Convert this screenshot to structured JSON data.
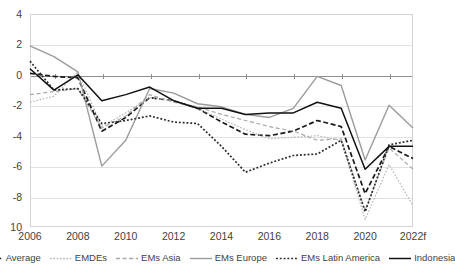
{
  "chart_data": {
    "type": "line",
    "title": "",
    "subtitle": "",
    "xlabel": "",
    "ylabel": "",
    "x": [
      2006,
      2007,
      2008,
      2009,
      2010,
      2011,
      2012,
      2013,
      2014,
      2015,
      2016,
      2017,
      2018,
      2019,
      2020,
      2021,
      2022
    ],
    "tick_labels": [
      "2006",
      "2008",
      "2010",
      "2012",
      "2014",
      "2016",
      "2018",
      "2020",
      "2022f"
    ],
    "tick_years": [
      2006,
      2008,
      2010,
      2012,
      2014,
      2016,
      2018,
      2020,
      2022
    ],
    "y_ticks": [
      "4",
      "2",
      "0",
      "-2",
      "-4",
      "-6",
      "-8",
      "10"
    ],
    "y_tick_values": [
      4,
      2,
      0,
      -2,
      -4,
      -6,
      -8,
      -10
    ],
    "ylim": [
      -10,
      4
    ],
    "xlim": [
      2006,
      2022
    ],
    "grid": true,
    "legend_position": "bottom",
    "series": [
      {
        "name": "Average",
        "style": "dashed",
        "color": "#1a1a1a",
        "values": [
          0.1,
          -0.1,
          -0.2,
          -3.7,
          -2.8,
          -1.5,
          -1.7,
          -2.2,
          -3.1,
          -3.9,
          -4.0,
          -3.7,
          -3.0,
          -3.4,
          -7.8,
          -4.7,
          -5.5
        ]
      },
      {
        "name": "EMDEs",
        "style": "dotted-light",
        "color": "#b5b5b5",
        "values": [
          -1.8,
          -1.4,
          0.2,
          -3.4,
          -2.5,
          -1.5,
          -1.7,
          -2.2,
          -2.9,
          -3.6,
          -4.2,
          -4.1,
          -4.0,
          -4.3,
          -9.5,
          -5.9,
          -8.6
        ]
      },
      {
        "name": "EMs Asia",
        "style": "dashed-light",
        "color": "#a8a8a8",
        "values": [
          -1.3,
          -1.1,
          -0.9,
          -3.5,
          -2.7,
          -1.3,
          -1.8,
          -2.1,
          -2.6,
          -3.0,
          -3.4,
          -3.7,
          -4.3,
          -4.2,
          -8.9,
          -4.8,
          -6.2
        ]
      },
      {
        "name": "EMs Europe",
        "style": "solid-light",
        "color": "#9b9b9b",
        "values": [
          1.9,
          1.2,
          0.2,
          -6.0,
          -4.3,
          -0.9,
          -1.2,
          -1.9,
          -2.1,
          -2.6,
          -2.8,
          -2.2,
          -0.1,
          -0.7,
          -5.6,
          -2.0,
          -3.5
        ]
      },
      {
        "name": "EMs Latin America",
        "style": "dotted",
        "color": "#2b2b2b",
        "values": [
          0.9,
          -1.0,
          -0.9,
          -3.2,
          -3.0,
          -2.7,
          -3.1,
          -3.2,
          -4.7,
          -6.4,
          -5.8,
          -5.3,
          -5.2,
          -4.3,
          -9.0,
          -4.6,
          -4.3
        ]
      },
      {
        "name": "Indonesia",
        "style": "solid",
        "color": "#111111",
        "values": [
          0.4,
          -1.0,
          0.0,
          -1.7,
          -1.3,
          -0.8,
          -1.7,
          -2.2,
          -2.2,
          -2.6,
          -2.5,
          -2.5,
          -1.8,
          -2.2,
          -6.2,
          -4.7,
          -4.7
        ]
      }
    ]
  }
}
